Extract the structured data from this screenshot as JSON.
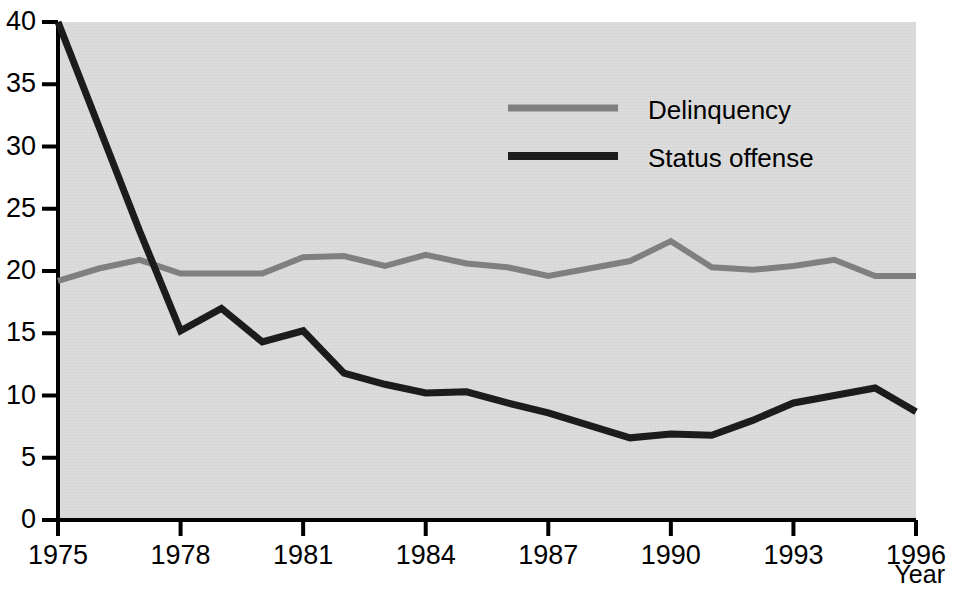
{
  "chart_data": {
    "type": "line",
    "title": "",
    "subtitle": "",
    "xlabel": "Year",
    "ylabel": "",
    "xlim": [
      1975,
      1996
    ],
    "ylim": [
      0,
      40
    ],
    "grid": false,
    "legend_position": "top-center-right",
    "x_tick_labels": [
      "1975",
      "1978",
      "1981",
      "1984",
      "1987",
      "1990",
      "1993",
      "1996"
    ],
    "x_tick_values": [
      1975,
      1978,
      1981,
      1984,
      1987,
      1990,
      1993,
      1996
    ],
    "y_tick_labels": [
      "0",
      "5",
      "10",
      "15",
      "20",
      "25",
      "30",
      "35",
      "40"
    ],
    "y_tick_values": [
      0,
      5,
      10,
      15,
      20,
      25,
      30,
      35,
      40
    ],
    "x": [
      1975,
      1976,
      1977,
      1978,
      1979,
      1980,
      1981,
      1982,
      1983,
      1984,
      1985,
      1986,
      1987,
      1988,
      1989,
      1990,
      1991,
      1992,
      1993,
      1994,
      1995,
      1996
    ],
    "series": [
      {
        "name": "Delinquency",
        "color": "#808080",
        "width": 6,
        "values": [
          19.2,
          20.2,
          20.9,
          19.8,
          19.8,
          19.8,
          21.1,
          21.2,
          20.4,
          21.3,
          20.6,
          20.3,
          19.6,
          20.2,
          20.8,
          22.4,
          20.3,
          20.1,
          20.4,
          20.9,
          19.6,
          19.6
        ]
      },
      {
        "name": "Status offense",
        "color": "#1a1a1a",
        "width": 7,
        "values": [
          40.0,
          31.6,
          23.2,
          15.2,
          17.0,
          14.3,
          15.2,
          11.8,
          10.9,
          10.2,
          10.3,
          9.4,
          8.6,
          7.6,
          6.6,
          6.9,
          6.8,
          8.0,
          9.4,
          10.0,
          10.6,
          8.7
        ]
      }
    ],
    "legend": [
      {
        "label": "Delinquency",
        "color": "#808080"
      },
      {
        "label": "Status offense",
        "color": "#1a1a1a"
      }
    ],
    "panel_background": "#dcdcdc",
    "axis_color": "#000000"
  }
}
